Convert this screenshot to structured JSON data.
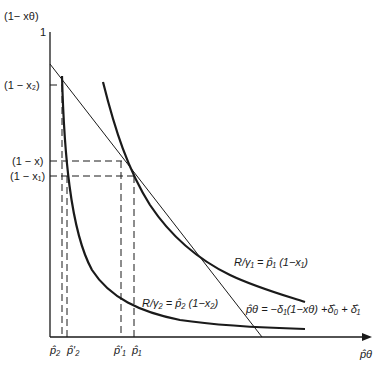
{
  "diagram": {
    "y_axis": {
      "label": "(1− xθ)",
      "top_tick": "1"
    },
    "x_axis": {
      "label": "p̂θ"
    },
    "y_ticks": [
      {
        "label": "(1 − x₂)",
        "y": 85
      },
      {
        "label": "(1 − x)",
        "y": 161
      },
      {
        "label": "(1 − x₁)",
        "y": 176
      }
    ],
    "x_ticks": [
      {
        "label": "p̂₂",
        "x": 62
      },
      {
        "label": "p̂′₂",
        "x": 67
      },
      {
        "label": "p̂′₁",
        "x": 121
      },
      {
        "label": "p̂₁",
        "x": 134
      }
    ],
    "curves": {
      "r_gamma1": "R/γ₁ = p̂₁ (1−x₁)",
      "r_gamma2": "R/γ₂ = p̂₂ (1−x₂)",
      "line": "p̂θ = −δ₁(1−xθ) +δ̂₀ + δ̂₁"
    },
    "colors": {
      "ink": "#1a1a1a",
      "background": "#ffffff"
    }
  }
}
